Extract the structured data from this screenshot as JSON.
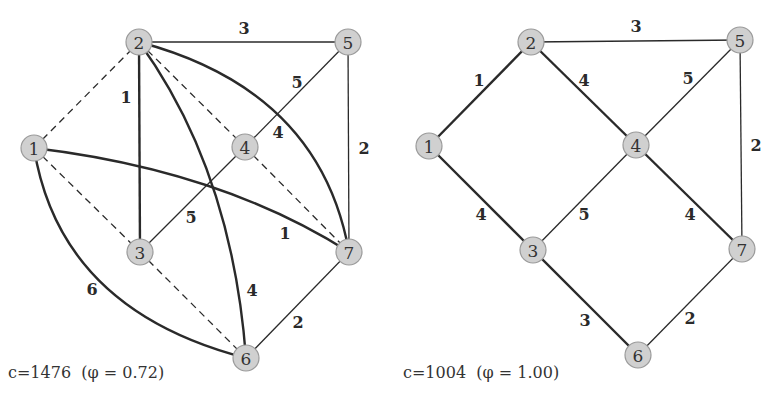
{
  "graphs": [
    {
      "id": "left",
      "caption": "c=1476  (φ = 0.72)",
      "caption_pos": [
        8,
        372
      ],
      "nodes": [
        {
          "id": "1",
          "x": 34,
          "y": 148
        },
        {
          "id": "2",
          "x": 139,
          "y": 42
        },
        {
          "id": "3",
          "x": 140,
          "y": 252
        },
        {
          "id": "4",
          "x": 245,
          "y": 147
        },
        {
          "id": "5",
          "x": 348,
          "y": 42
        },
        {
          "id": "6",
          "x": 246,
          "y": 358
        },
        {
          "id": "7",
          "x": 349,
          "y": 252
        }
      ],
      "edges": [
        {
          "from": "2",
          "to": "5",
          "weight": "3",
          "style": "thin",
          "label_pos": [
            244,
            28
          ]
        },
        {
          "from": "5",
          "to": "7",
          "weight": "2",
          "style": "thin",
          "label_pos": [
            364,
            148
          ]
        },
        {
          "from": "4",
          "to": "5",
          "weight": "5",
          "style": "thin",
          "label_pos": [
            297,
            82
          ]
        },
        {
          "from": "3",
          "to": "4",
          "weight": "5",
          "style": "thin",
          "label_pos": [
            191,
            217
          ]
        },
        {
          "from": "6",
          "to": "7",
          "weight": "2",
          "style": "thin",
          "label_pos": [
            298,
            322
          ]
        },
        {
          "from": "2",
          "to": "3",
          "weight": "1",
          "style": "thick",
          "label_pos": [
            126,
            97
          ]
        },
        {
          "from": "2",
          "to": "6",
          "weight": "4",
          "style": "thick",
          "curve": [
            232,
            170
          ],
          "label_pos": [
            252,
            290
          ]
        },
        {
          "from": "2",
          "to": "7",
          "weight": "4",
          "style": "thick",
          "curve": [
            320,
            90
          ],
          "label_pos": [
            278,
            132
          ]
        },
        {
          "from": "1",
          "to": "7",
          "weight": "1",
          "style": "thick",
          "curve": [
            220,
            170
          ],
          "label_pos": [
            285,
            233
          ]
        },
        {
          "from": "1",
          "to": "6",
          "weight": "6",
          "style": "thick",
          "curve": [
            60,
            310
          ],
          "label_pos": [
            92,
            289
          ]
        },
        {
          "from": "1",
          "to": "2",
          "weight": "",
          "style": "dashed"
        },
        {
          "from": "2",
          "to": "4",
          "weight": "",
          "style": "dashed"
        },
        {
          "from": "4",
          "to": "7",
          "weight": "",
          "style": "dashed"
        },
        {
          "from": "1",
          "to": "3",
          "weight": "",
          "style": "dashed"
        },
        {
          "from": "3",
          "to": "6",
          "weight": "",
          "style": "dashed"
        }
      ]
    },
    {
      "id": "right",
      "caption": "c=1004  (φ = 1.00)",
      "caption_pos": [
        403,
        372
      ],
      "nodes": [
        {
          "id": "1",
          "x": 429,
          "y": 146
        },
        {
          "id": "2",
          "x": 531,
          "y": 42
        },
        {
          "id": "3",
          "x": 533,
          "y": 250
        },
        {
          "id": "4",
          "x": 636,
          "y": 145
        },
        {
          "id": "5",
          "x": 740,
          "y": 40
        },
        {
          "id": "6",
          "x": 638,
          "y": 355
        },
        {
          "id": "7",
          "x": 742,
          "y": 249
        }
      ],
      "edges": [
        {
          "from": "1",
          "to": "2",
          "weight": "1",
          "style": "thick",
          "label_pos": [
            479,
            80
          ]
        },
        {
          "from": "2",
          "to": "4",
          "weight": "4",
          "style": "thick",
          "label_pos": [
            584,
            80
          ]
        },
        {
          "from": "2",
          "to": "5",
          "weight": "3",
          "style": "thin",
          "label_pos": [
            636,
            26
          ]
        },
        {
          "from": "4",
          "to": "5",
          "weight": "5",
          "style": "thin",
          "label_pos": [
            688,
            78
          ]
        },
        {
          "from": "5",
          "to": "7",
          "weight": "2",
          "style": "thin",
          "label_pos": [
            756,
            145
          ]
        },
        {
          "from": "1",
          "to": "3",
          "weight": "4",
          "style": "thick",
          "label_pos": [
            481,
            214
          ]
        },
        {
          "from": "3",
          "to": "4",
          "weight": "5",
          "style": "thin",
          "label_pos": [
            584,
            214
          ]
        },
        {
          "from": "4",
          "to": "7",
          "weight": "4",
          "style": "thick",
          "label_pos": [
            690,
            214
          ]
        },
        {
          "from": "3",
          "to": "6",
          "weight": "3",
          "style": "thick",
          "label_pos": [
            585,
            320
          ]
        },
        {
          "from": "6",
          "to": "7",
          "weight": "2",
          "style": "thin",
          "label_pos": [
            690,
            318
          ]
        }
      ]
    }
  ],
  "node_radius": 13
}
